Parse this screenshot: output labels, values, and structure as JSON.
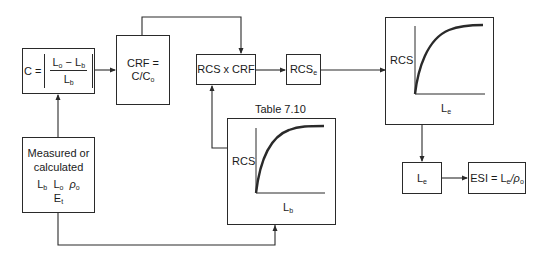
{
  "blocks": {
    "concentration": {
      "lhs": "C =",
      "numerator": {
        "a": "L",
        "a_sub": "o",
        "op": "−",
        "b": "L",
        "b_sub": "b"
      },
      "denominator": {
        "v": "L",
        "v_sub": "b"
      }
    },
    "crf": {
      "line1": "CRF =",
      "line2_main": "C/C",
      "line2_sub": "o"
    },
    "rcs_x_crf": {
      "label": "RCS x CRF"
    },
    "rcs_e": {
      "main": "RCS",
      "sub": "e"
    },
    "measured": {
      "line1": "Measured or",
      "line2": "calculated",
      "vars": [
        {
          "main": "L",
          "sub": "b"
        },
        {
          "main": "L",
          "sub": "o"
        },
        {
          "main": "ρ",
          "sub": "o"
        }
      ],
      "line4_main": "E",
      "line4_sub": "t"
    },
    "le": {
      "main": "L",
      "sub": "e"
    },
    "esi": {
      "prefix": "ESI = L",
      "sub1": "e",
      "mid": "/ρ",
      "sub2": "o"
    }
  },
  "graphs": {
    "table_graph": {
      "caption": "Table 7.10",
      "y_label": "RCS",
      "x_label_main": "L",
      "x_label_sub": "b"
    },
    "output_graph": {
      "y_label": "RCS",
      "x_label_main": "L",
      "x_label_sub": "e"
    }
  },
  "colors": {
    "line": "#2a2a2a",
    "background": "#ffffff"
  }
}
